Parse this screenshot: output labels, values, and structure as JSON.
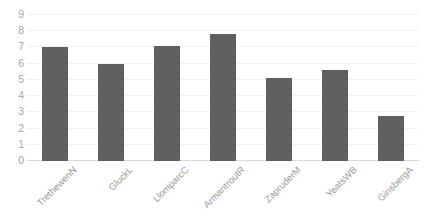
{
  "chart_data": {
    "type": "bar",
    "title": "",
    "subtitle": "",
    "xlabel": "",
    "ylabel": "",
    "categories": [
      "TrethewenN",
      "GluckL",
      "LlomparcC",
      "ArmantroutR",
      "ZapruderM",
      "YeatsWB",
      "GinsbergA"
    ],
    "values": [
      7.0,
      6.0,
      7.1,
      7.8,
      5.1,
      5.6,
      2.8
    ],
    "ylim": [
      0,
      9
    ],
    "yticks": [
      "0",
      "1",
      "2",
      "3",
      "4",
      "5",
      "6",
      "7",
      "8",
      "9"
    ],
    "ytick_values": [
      0,
      1,
      2,
      3,
      4,
      5,
      6,
      7,
      8,
      9
    ],
    "grid": true,
    "legend": false,
    "legend_position": "none",
    "bar_color": "#5f5f5f",
    "gridline_color": "#f0f0f0",
    "axis_color": "#d9d9d9",
    "tick_label_color": "#a6a6a6",
    "category_label_color": "#9a9a9a",
    "background_color": "#ffffff",
    "category_label_rotation": -45
  }
}
